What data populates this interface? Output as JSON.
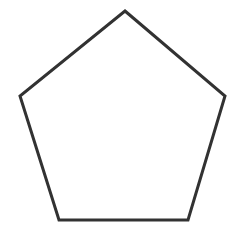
{
  "figure": {
    "name": "pentagon",
    "shape_type": "regular-pentagon",
    "sides": 5,
    "orientation": "apex-up",
    "label": "Regular pentagon outline",
    "background_color": "#ffffff",
    "stroke_color": "#323232",
    "fill_color": "#ffffff",
    "stroke_width_px": 3,
    "canvas": {
      "width": 237,
      "height": 231
    },
    "vertices": [
      {
        "name": "apex",
        "x": 125,
        "y": 11
      },
      {
        "name": "upper-right",
        "x": 225,
        "y": 96
      },
      {
        "name": "lower-right",
        "x": 188,
        "y": 220
      },
      {
        "name": "lower-left",
        "x": 59,
        "y": 220
      },
      {
        "name": "upper-left",
        "x": 20,
        "y": 96
      }
    ],
    "points_attr": "125,11 225,96 188,220 59,220 20,96"
  }
}
